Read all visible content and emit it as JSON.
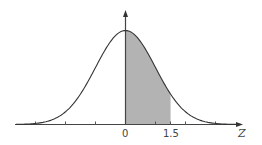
{
  "chart_data": {
    "type": "area",
    "title": "",
    "xlabel": "Z",
    "ylabel": "",
    "xlim": [
      -3.7,
      3.9
    ],
    "ylim": [
      0,
      0.45
    ],
    "grid": false,
    "legend": null,
    "x_tick_positions": [
      -3,
      -2,
      -1,
      0,
      1,
      1.5,
      2,
      3
    ],
    "x_tick_labels": [
      {
        "value": 0,
        "label": "0"
      },
      {
        "value": 1.5,
        "label": "1.5"
      }
    ],
    "series": [
      {
        "name": "standard normal density",
        "function": "exp(-z^2/2)/sqrt(2*pi)",
        "x": [
          -3.5,
          -3,
          -2.5,
          -2,
          -1.5,
          -1,
          -0.5,
          0,
          0.5,
          1,
          1.5,
          2,
          2.5,
          3,
          3.5
        ],
        "values": [
          0.0009,
          0.0044,
          0.0175,
          0.054,
          0.1295,
          0.242,
          0.3521,
          0.3989,
          0.3521,
          0.242,
          0.1295,
          0.054,
          0.0175,
          0.0044,
          0.0009
        ]
      }
    ],
    "shaded_region": {
      "from": 0,
      "to": 1.5,
      "color": "#b3b3b3"
    },
    "annotations": []
  },
  "labels": {
    "zero": "0",
    "one_five": "1.5",
    "axis": "Z"
  },
  "colors": {
    "curve": "#333333",
    "axis": "#444444",
    "shade": "#b3b3b3"
  }
}
